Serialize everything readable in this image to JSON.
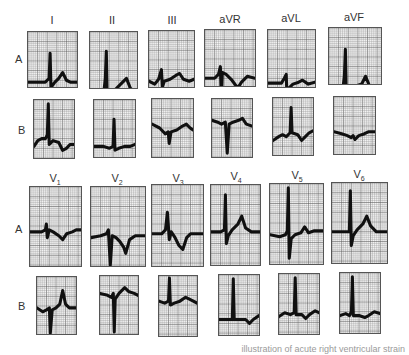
{
  "figure": {
    "rows": [
      {
        "label": "A",
        "label_pos": [
          15,
          53
        ]
      },
      {
        "label": "B",
        "label_pos": [
          18,
          124
        ]
      },
      {
        "label": "A",
        "label_pos": [
          15,
          223
        ]
      },
      {
        "label": "B",
        "label_pos": [
          18,
          300
        ]
      }
    ],
    "lead_headers_limb": [
      {
        "text": "I",
        "x": 52,
        "y": 14
      },
      {
        "text": "II",
        "x": 112,
        "y": 14
      },
      {
        "text": "III",
        "x": 172,
        "y": 14
      },
      {
        "text": "aVR",
        "x": 230,
        "y": 13
      },
      {
        "text": "aVL",
        "x": 291,
        "y": 12
      },
      {
        "text": "aVF",
        "x": 354,
        "y": 11
      }
    ],
    "lead_headers_precordial": [
      {
        "text": "V",
        "sub": "1",
        "x": 55,
        "y": 172
      },
      {
        "text": "V",
        "sub": "2",
        "x": 117,
        "y": 172
      },
      {
        "text": "V",
        "sub": "3",
        "x": 178,
        "y": 172
      },
      {
        "text": "V",
        "sub": "4",
        "x": 236,
        "y": 170
      },
      {
        "text": "V",
        "sub": "5",
        "x": 297,
        "y": 169
      },
      {
        "text": "V",
        "sub": "6",
        "x": 359,
        "y": 168
      }
    ],
    "panels": [
      {
        "lead": "I",
        "row": "A",
        "box": [
          27,
          31,
          51,
          57
        ],
        "trace": "M0,52 L18,52 L20,50 L22,48 L23,22 L24,62 L25,56 L28,52 L32,48 L36,42 L40,50 L44,52 L51,52"
      },
      {
        "lead": "II",
        "row": "A",
        "box": [
          89,
          31,
          49,
          58
        ],
        "trace": "M0,65 L6,62 L10,64 L14,66 L16,48 L17,20 L18,72 L20,64 L26,60 L32,54 L38,48 L42,58 L49,66"
      },
      {
        "lead": "III",
        "row": "A",
        "box": [
          148,
          30,
          47,
          58
        ],
        "trace": "M0,52 L6,55 L10,50 L13,40 L14,58 L16,52 L22,50 L28,46 L32,44 L36,50 L42,52 L47,50"
      },
      {
        "lead": "aVR",
        "row": "A",
        "box": [
          204,
          29,
          52,
          58
        ],
        "trace": "M0,50 L10,50 L14,46 L16,38 L17,75 L18,44 L22,46 L28,52 L34,60 L38,54 L44,48 L52,50"
      },
      {
        "lead": "aVL",
        "row": "A",
        "box": [
          267,
          29,
          49,
          59
        ],
        "trace": "M0,55 L14,55 L17,50 L19,46 L20,75 L22,60 L26,56 L32,54 L36,52 L42,56 L49,54"
      },
      {
        "lead": "aVF",
        "row": "A",
        "box": [
          328,
          27,
          54,
          58
        ],
        "trace": "M0,66 L6,62 L10,64 L14,66 L16,50 L17,22 L18,72 L22,64 L28,60 L34,58 L38,50 L42,60 L48,64 L54,66"
      },
      {
        "lead": "I",
        "row": "B",
        "box": [
          33,
          99,
          42,
          60
        ],
        "trace": "M0,48 L4,42 L8,40 L12,40 L14,36 L15,4 L16,46 L20,42 L26,44 L30,52 L34,50 L38,46 L42,46"
      },
      {
        "lead": "II",
        "row": "B",
        "box": [
          93,
          99,
          43,
          59
        ],
        "trace": "M0,48 L10,48 L16,50 L20,48 L21,20 L22,52 L26,50 L32,48 L38,48 L43,46"
      },
      {
        "lead": "III",
        "row": "B",
        "box": [
          151,
          98,
          43,
          60
        ],
        "trace": "M0,26 L8,30 L14,36 L17,34 L18,46 L20,34 L26,32 L32,28 L36,26 L40,30 L43,32"
      },
      {
        "lead": "aVR",
        "row": "B",
        "box": [
          211,
          98,
          42,
          60
        ],
        "trace": "M0,22 L6,24 L10,26 L14,24 L16,56 L18,26 L22,24 L28,22 L32,20 L36,26 L42,28"
      },
      {
        "lead": "aVL",
        "row": "B",
        "box": [
          272,
          97,
          42,
          59
        ],
        "trace": "M0,44 L6,40 L10,38 L14,40 L18,36 L19,10 L20,36 L26,38 L30,44 L34,40 L38,36 L42,34"
      },
      {
        "lead": "aVF",
        "row": "B",
        "box": [
          333,
          96,
          43,
          59
        ],
        "trace": "M0,36 L8,38 L14,40 L18,42 L20,40 L22,44 L26,40 L32,38 L36,36 L43,36"
      },
      {
        "lead": "V1",
        "row": "A",
        "box": [
          29,
          186,
          53,
          81
        ],
        "trace": "M0,46 L12,46 L16,44 L17,38 L18,52 L20,44 L24,46 L30,50 L34,54 L38,48 L44,46 L48,44 L53,44"
      },
      {
        "lead": "V2",
        "row": "A",
        "box": [
          90,
          186,
          56,
          81
        ],
        "trace": "M0,52 L10,50 L16,48 L18,44 L20,80 L22,50 L26,52 L30,56 L34,62 L36,68 L40,54 L46,50 L56,50"
      },
      {
        "lead": "V3",
        "row": "A",
        "box": [
          151,
          184,
          53,
          83
        ],
        "trace": "M0,50 L10,50 L14,46 L16,28 L18,56 L20,48 L24,54 L28,62 L32,66 L36,54 L40,50 L46,50 L53,50"
      },
      {
        "lead": "V4",
        "row": "A",
        "box": [
          210,
          184,
          51,
          82
        ],
        "trace": "M0,48 L10,48 L14,46 L15,10 L16,60 L18,52 L22,46 L28,40 L32,32 L36,44 L42,48 L51,48"
      },
      {
        "lead": "V5",
        "row": "A",
        "box": [
          269,
          183,
          55,
          82
        ],
        "trace": "M0,52 L10,54 L16,52 L18,48 L19,4 L20,76 L22,56 L26,52 L32,50 L36,44 L40,50 L46,48 L55,48"
      },
      {
        "lead": "V6",
        "row": "A",
        "box": [
          331,
          182,
          57,
          82
        ],
        "trace": "M0,50 L12,50 L18,50 L19,8 L20,64 L22,54 L26,48 L32,42 L36,34 L40,44 L46,50 L57,50"
      },
      {
        "lead": "V1",
        "row": "B",
        "box": [
          36,
          276,
          41,
          59
        ],
        "trace": "M0,32 L6,36 L10,34 L13,32 L14,58 L16,34 L20,32 L24,28 L27,14 L30,28 L34,32 L41,32"
      },
      {
        "lead": "V2",
        "row": "B",
        "box": [
          99,
          275,
          40,
          60
        ],
        "trace": "M0,18 L8,20 L12,22 L14,18 L15,58 L16,24 L20,18 L26,12 L30,16 L36,18 L40,20"
      },
      {
        "lead": "V3",
        "row": "B",
        "box": [
          158,
          275,
          40,
          62
        ],
        "trace": "M0,26 L6,28 L10,26 L11,2 L12,30 L16,28 L22,26 L28,22 L32,24 L40,28"
      },
      {
        "lead": "V4",
        "row": "B",
        "box": [
          218,
          274,
          42,
          62
        ],
        "trace": "M0,46 L10,46 L14,46 L15,4 L16,46 L22,46 L28,46 L32,50 L36,46 L42,42"
      },
      {
        "lead": "V5",
        "row": "B",
        "box": [
          278,
          273,
          42,
          62
        ],
        "trace": "M0,44 L6,40 L12,42 L16,40 L17,4 L18,42 L24,42 L28,46 L32,42 L38,38 L42,40"
      },
      {
        "lead": "V6",
        "row": "B",
        "box": [
          339,
          272,
          42,
          62
        ],
        "trace": "M0,44 L6,42 L10,44 L12,40 L13,4 L14,44 L20,44 L26,46 L30,44 L36,40 L42,42"
      }
    ],
    "caption": "illustration of acute right ventricular strain",
    "colors": {
      "grid_line": "#8a8a8a",
      "grid_major": "#5a5a5a",
      "trace": "#111111",
      "paper": "#fafafa"
    }
  }
}
